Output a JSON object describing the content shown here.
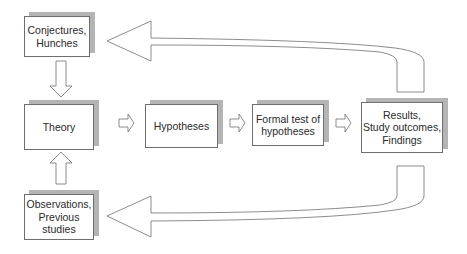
{
  "diagram": {
    "type": "research-process-flow",
    "nodes": [
      {
        "id": "conjectures",
        "label": "Conjectures,\nHunches"
      },
      {
        "id": "theory",
        "label": "Theory"
      },
      {
        "id": "observations",
        "label": "Observations,\nPrevious\nstudies"
      },
      {
        "id": "hypotheses",
        "label": "Hypotheses"
      },
      {
        "id": "formal_test",
        "label": "Formal test of\nhypotheses"
      },
      {
        "id": "results",
        "label": "Results,\nStudy outcomes,\nFindings"
      }
    ],
    "edges": [
      {
        "from": "conjectures",
        "to": "theory"
      },
      {
        "from": "observations",
        "to": "theory"
      },
      {
        "from": "theory",
        "to": "hypotheses"
      },
      {
        "from": "hypotheses",
        "to": "formal_test"
      },
      {
        "from": "formal_test",
        "to": "results"
      },
      {
        "from": "results",
        "to": "conjectures"
      },
      {
        "from": "results",
        "to": "observations"
      }
    ],
    "colors": {
      "border": "#6e6e6e",
      "shadow": "#b4b4b4",
      "background": "#ffffff",
      "text": "#2a2a2a"
    }
  }
}
